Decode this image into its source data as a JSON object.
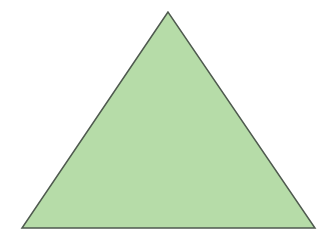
{
  "background": "#ffffff",
  "shape": {
    "type": "triangle",
    "kind": "isosceles",
    "fill": "#b6dca8",
    "stroke": "#4f5a4f",
    "stroke_width": 1.5,
    "points": {
      "apex": [
        168,
        12
      ],
      "bottom_left": [
        22,
        228
      ],
      "bottom_right": [
        315,
        228
      ]
    }
  }
}
